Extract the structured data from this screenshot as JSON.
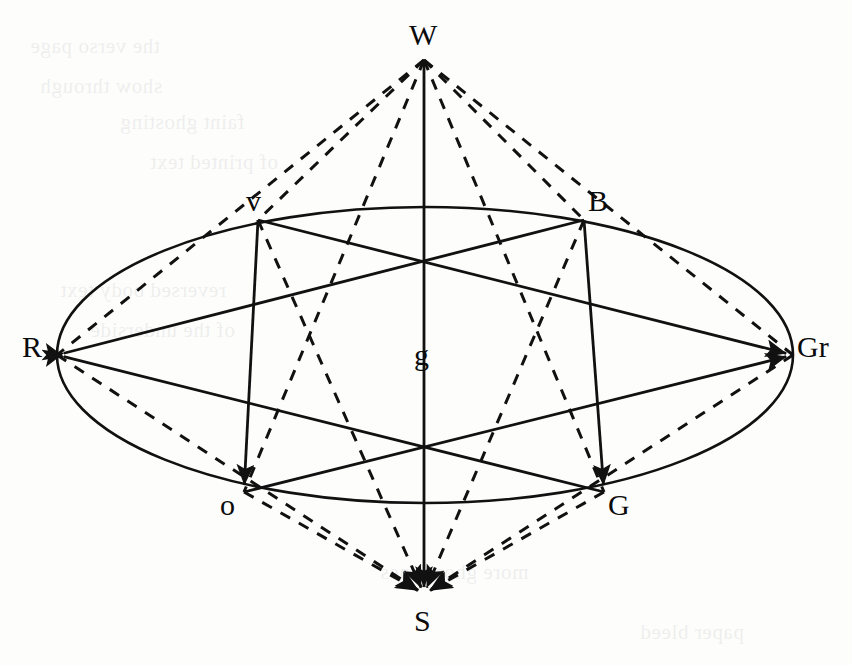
{
  "figure": {
    "canvas": {
      "width": 852,
      "height": 665
    },
    "stroke_color": "#111111",
    "background_color": "#ffffff",
    "nodes": [
      {
        "id": "W",
        "label": "W",
        "x": 424,
        "y": 60,
        "label_x": 409,
        "label_y": 20,
        "role": "upper-apex"
      },
      {
        "id": "S",
        "label": "S",
        "x": 424,
        "y": 594,
        "label_x": 414,
        "label_y": 606,
        "role": "lower-apex"
      },
      {
        "id": "g",
        "label": "g",
        "x": 424,
        "y": 322,
        "label_x": 414,
        "label_y": 340,
        "role": "center"
      },
      {
        "id": "R",
        "label": "R",
        "x": 57,
        "y": 355,
        "label_x": 22,
        "label_y": 332,
        "role": "equator-left"
      },
      {
        "id": "Gr",
        "label": "Gr",
        "x": 793,
        "y": 355,
        "label_x": 797,
        "label_y": 332,
        "role": "equator-right"
      },
      {
        "id": "v",
        "label": "v",
        "x": 258,
        "y": 220,
        "label_x": 246,
        "label_y": 186,
        "role": "equator-upper-left"
      },
      {
        "id": "B",
        "label": "B",
        "x": 584,
        "y": 220,
        "label_x": 588,
        "label_y": 186,
        "role": "equator-upper-right"
      },
      {
        "id": "o",
        "label": "o",
        "x": 244,
        "y": 492,
        "label_x": 220,
        "label_y": 490,
        "role": "equator-lower-left"
      },
      {
        "id": "G",
        "label": "G",
        "x": 604,
        "y": 492,
        "label_x": 608,
        "label_y": 490,
        "role": "equator-lower-right"
      }
    ],
    "ellipse": {
      "cx": 425,
      "cy": 355,
      "rx": 368,
      "ry": 148,
      "style": "solid"
    },
    "solid_edges": [
      {
        "from": "W",
        "to": "g",
        "arrow": "none"
      },
      {
        "from": "R",
        "to": "B",
        "arrow": "start"
      },
      {
        "from": "R",
        "to": "G",
        "arrow": "start"
      },
      {
        "from": "v",
        "to": "Gr",
        "arrow": "end"
      },
      {
        "from": "o",
        "to": "Gr",
        "arrow": "end"
      },
      {
        "from": "v",
        "to": "o",
        "arrow": "end"
      },
      {
        "from": "B",
        "to": "G",
        "arrow": "end"
      },
      {
        "from": "g",
        "to": "S",
        "arrow": "end"
      }
    ],
    "dashed_edges": [
      {
        "from": "W",
        "to": "R",
        "arrow": "none"
      },
      {
        "from": "W",
        "to": "v",
        "arrow": "none"
      },
      {
        "from": "W",
        "to": "o",
        "arrow": "none"
      },
      {
        "from": "W",
        "to": "G",
        "arrow": "none"
      },
      {
        "from": "W",
        "to": "B",
        "arrow": "none"
      },
      {
        "from": "W",
        "to": "Gr",
        "arrow": "none"
      },
      {
        "from": "o",
        "to": "S",
        "arrow": "end"
      },
      {
        "from": "v",
        "to": "S",
        "arrow": "end"
      },
      {
        "from": "B",
        "to": "S",
        "arrow": "end"
      },
      {
        "from": "G",
        "to": "S",
        "arrow": "end"
      },
      {
        "from": "R",
        "to": "S",
        "arrow": "end"
      },
      {
        "from": "Gr",
        "to": "S",
        "arrow": "end"
      }
    ]
  },
  "bleed_text": [
    {
      "text": "the verso page",
      "x": 30,
      "y": 34
    },
    {
      "text": "show through",
      "x": 40,
      "y": 74
    },
    {
      "text": "faint ghosting",
      "x": 120,
      "y": 110
    },
    {
      "text": "of printed text",
      "x": 150,
      "y": 150
    },
    {
      "text": "reversed body text",
      "x": 60,
      "y": 278
    },
    {
      "text": "of the underside",
      "x": 90,
      "y": 318
    },
    {
      "text": "more ghost lines",
      "x": 380,
      "y": 560
    },
    {
      "text": "paper bleed",
      "x": 640,
      "y": 620
    }
  ]
}
